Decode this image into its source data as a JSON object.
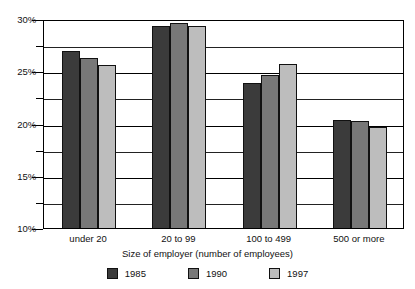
{
  "chart_data": {
    "type": "bar",
    "title": "",
    "subtitle": "",
    "xlabel": "Size of employer (number of employees)",
    "ylabel": "",
    "categories": [
      "under 20",
      "20 to 99",
      "100 to 499",
      "500 or more"
    ],
    "series": [
      {
        "name": "1985",
        "color": "#3b3b3b",
        "values": [
          26.9,
          29.3,
          23.9,
          20.3
        ]
      },
      {
        "name": "1990",
        "color": "#787878",
        "values": [
          26.3,
          29.6,
          24.6,
          20.2
        ]
      },
      {
        "name": "1997",
        "color": "#bdbdbd",
        "values": [
          25.6,
          29.3,
          25.7,
          19.7
        ]
      }
    ],
    "ylim": [
      10,
      30
    ],
    "ytick_labels": [
      "10%",
      "15%",
      "20%",
      "25%",
      "30%"
    ],
    "ytick_values": [
      10,
      15,
      20,
      25,
      30
    ],
    "yminor_values": [
      12.5,
      17.5,
      22.5,
      27.5
    ],
    "value_suffix": "%",
    "grid": true,
    "grid_axis": "y",
    "legend_position": "bottom",
    "bar_gap_within_group": 0
  }
}
